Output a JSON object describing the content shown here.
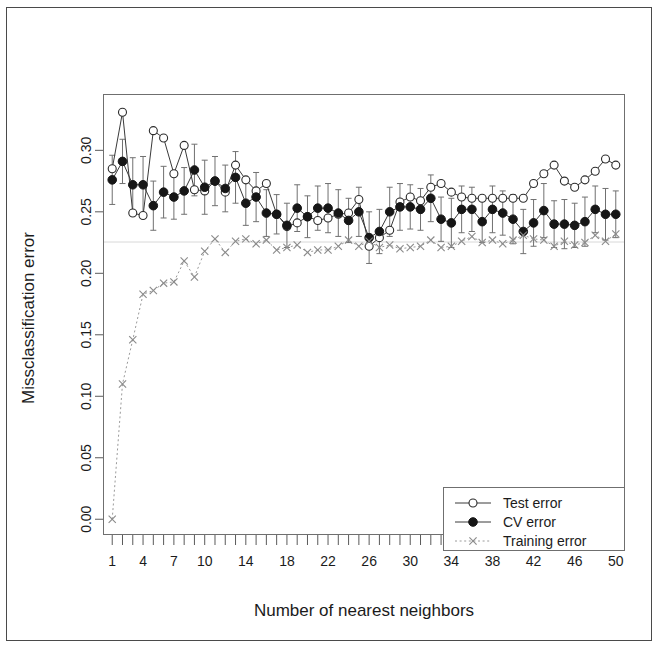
{
  "figure": {
    "kind": "scatter-line-plot-with-errorbars",
    "background": "#ffffff",
    "border_color": "#4a4a4a"
  },
  "chart_data": {
    "type": "line",
    "title": "",
    "subtitle": "",
    "xlabel": "Number of nearest neighbors",
    "ylabel": "Missclassification error",
    "xlim": [
      0.2,
      50.8
    ],
    "ylim": [
      -0.012,
      0.345
    ],
    "grid": false,
    "legend_position": "bottom-right",
    "x_tick_labels": [
      "1",
      "4",
      "7",
      "10",
      "14",
      "18",
      "22",
      "26",
      "30",
      "34",
      "38",
      "42",
      "46",
      "50"
    ],
    "x_tick_values": [
      1,
      4,
      7,
      10,
      14,
      18,
      22,
      26,
      30,
      34,
      38,
      42,
      46,
      50
    ],
    "y_tick_labels": [
      "0.00",
      "0.05",
      "0.10",
      "0.15",
      "0.20",
      "0.25",
      "0.30"
    ],
    "y_tick_values": [
      0.0,
      0.05,
      0.1,
      0.15,
      0.2,
      0.25,
      0.3
    ],
    "x": [
      1,
      2,
      3,
      4,
      5,
      6,
      7,
      8,
      9,
      10,
      11,
      12,
      13,
      14,
      15,
      16,
      17,
      18,
      19,
      20,
      21,
      22,
      23,
      24,
      25,
      26,
      27,
      28,
      29,
      30,
      31,
      32,
      33,
      34,
      35,
      36,
      37,
      38,
      39,
      40,
      41,
      42,
      43,
      44,
      45,
      46,
      47,
      48,
      49,
      50
    ],
    "series": [
      {
        "name": "Test error",
        "marker": "open-circle",
        "line_style": "solid",
        "color": "#2c2c2c",
        "values": [
          0.285,
          0.331,
          0.249,
          0.247,
          0.316,
          0.31,
          0.281,
          0.304,
          0.268,
          0.267,
          0.275,
          0.266,
          0.288,
          0.276,
          0.267,
          0.273,
          0.248,
          0.238,
          0.241,
          0.246,
          0.243,
          0.245,
          0.248,
          0.249,
          0.26,
          0.222,
          0.229,
          0.235,
          0.258,
          0.262,
          0.259,
          0.27,
          0.273,
          0.266,
          0.262,
          0.261,
          0.261,
          0.261,
          0.261,
          0.261,
          0.261,
          0.273,
          0.281,
          0.288,
          0.275,
          0.27,
          0.276,
          0.283,
          0.293,
          0.288
        ]
      },
      {
        "name": "CV error",
        "marker": "filled-circle",
        "line_style": "solid",
        "color": "#161616",
        "values": [
          0.276,
          0.291,
          0.272,
          0.272,
          0.255,
          0.266,
          0.262,
          0.267,
          0.284,
          0.27,
          0.275,
          0.269,
          0.278,
          0.257,
          0.262,
          0.249,
          0.248,
          0.239,
          0.253,
          0.246,
          0.253,
          0.253,
          0.249,
          0.243,
          0.25,
          0.229,
          0.234,
          0.25,
          0.254,
          0.254,
          0.252,
          0.261,
          0.244,
          0.241,
          0.252,
          0.252,
          0.242,
          0.252,
          0.249,
          0.244,
          0.234,
          0.241,
          0.251,
          0.24,
          0.24,
          0.239,
          0.242,
          0.252,
          0.248,
          0.248
        ],
        "error": [
          0.02,
          0.018,
          0.022,
          0.023,
          0.02,
          0.021,
          0.018,
          0.019,
          0.021,
          0.022,
          0.02,
          0.019,
          0.021,
          0.018,
          0.02,
          0.019,
          0.016,
          0.018,
          0.019,
          0.017,
          0.018,
          0.02,
          0.019,
          0.018,
          0.02,
          0.021,
          0.018,
          0.02,
          0.019,
          0.018,
          0.017,
          0.019,
          0.018,
          0.02,
          0.019,
          0.018,
          0.017,
          0.019,
          0.018,
          0.02,
          0.018,
          0.019,
          0.022,
          0.019,
          0.02,
          0.018,
          0.02,
          0.019,
          0.021,
          0.019
        ]
      },
      {
        "name": "Training error",
        "marker": "cross",
        "line_style": "dashed",
        "color": "#8a8a8a",
        "values": [
          0.0,
          0.11,
          0.146,
          0.183,
          0.186,
          0.192,
          0.193,
          0.21,
          0.197,
          0.218,
          0.228,
          0.217,
          0.226,
          0.228,
          0.224,
          0.227,
          0.219,
          0.221,
          0.223,
          0.217,
          0.219,
          0.219,
          0.222,
          0.227,
          0.222,
          0.226,
          0.221,
          0.223,
          0.22,
          0.221,
          0.222,
          0.227,
          0.221,
          0.222,
          0.226,
          0.23,
          0.225,
          0.227,
          0.224,
          0.227,
          0.231,
          0.228,
          0.227,
          0.222,
          0.226,
          0.223,
          0.225,
          0.231,
          0.226,
          0.232
        ]
      }
    ]
  },
  "legend": {
    "entries": [
      {
        "label": "Test error",
        "marker": "open-circle",
        "line_style": "solid"
      },
      {
        "label": "CV error",
        "marker": "filled-circle",
        "line_style": "solid"
      },
      {
        "label": "Training error",
        "marker": "cross",
        "line_style": "dashed"
      }
    ]
  }
}
